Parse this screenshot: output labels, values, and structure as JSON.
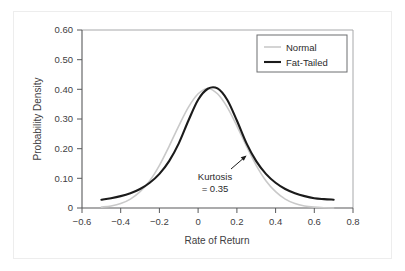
{
  "chart_data": {
    "type": "line",
    "title": "",
    "xlabel": "Rate of Return",
    "ylabel": "Probability Density",
    "xlim": [
      -0.6,
      0.8
    ],
    "ylim": [
      0.0,
      0.6
    ],
    "xticks": [
      "−0.6",
      "−0.4",
      "−0.2",
      "0",
      "0.2",
      "0.4",
      "0.6",
      "0.8"
    ],
    "xtick_values": [
      -0.6,
      -0.4,
      -0.2,
      0,
      0.2,
      0.4,
      0.6,
      0.8
    ],
    "yticks": [
      "0",
      "0.10",
      "0.20",
      "0.30",
      "0.40",
      "0.50",
      "0.60"
    ],
    "ytick_values": [
      0,
      0.1,
      0.2,
      0.3,
      0.4,
      0.5,
      0.6
    ],
    "grid": false,
    "legend_position": "top-right",
    "series": [
      {
        "name": "Normal",
        "color": "#c9c9c9",
        "linewidth": 1.6,
        "x": [
          -0.5,
          -0.45,
          -0.4,
          -0.35,
          -0.3,
          -0.25,
          -0.2,
          -0.15,
          -0.1,
          -0.05,
          0.0,
          0.05,
          0.1,
          0.15,
          0.2,
          0.25,
          0.3,
          0.35,
          0.4,
          0.45,
          0.5,
          0.55,
          0.6,
          0.65,
          0.7
        ],
        "y": [
          0.003,
          0.007,
          0.015,
          0.03,
          0.055,
          0.092,
          0.144,
          0.208,
          0.277,
          0.34,
          0.385,
          0.403,
          0.385,
          0.34,
          0.277,
          0.208,
          0.144,
          0.092,
          0.055,
          0.03,
          0.015,
          0.007,
          0.003,
          0.001,
          0.0
        ]
      },
      {
        "name": "Fat-Tailed",
        "color": "#1b1b1b",
        "linewidth": 2.1,
        "x": [
          -0.5,
          -0.45,
          -0.4,
          -0.35,
          -0.3,
          -0.25,
          -0.2,
          -0.15,
          -0.1,
          -0.05,
          0.0,
          0.05,
          0.1,
          0.15,
          0.2,
          0.25,
          0.3,
          0.35,
          0.4,
          0.45,
          0.5,
          0.55,
          0.6,
          0.65,
          0.7
        ],
        "y": [
          0.028,
          0.033,
          0.04,
          0.05,
          0.064,
          0.085,
          0.115,
          0.158,
          0.218,
          0.295,
          0.365,
          0.402,
          0.403,
          0.365,
          0.295,
          0.218,
          0.158,
          0.115,
          0.085,
          0.064,
          0.05,
          0.04,
          0.033,
          0.03,
          0.028
        ]
      }
    ],
    "annotations": [
      {
        "name": "kurtosis-annotation",
        "line1": "Kurtosis",
        "line2": "= 0.35",
        "value": 0.35,
        "points_to_series": "Fat-Tailed"
      }
    ]
  },
  "legend": {
    "entries": [
      {
        "label": "Normal",
        "color": "#c9c9c9"
      },
      {
        "label": "Fat-Tailed",
        "color": "#1b1b1b"
      }
    ]
  }
}
